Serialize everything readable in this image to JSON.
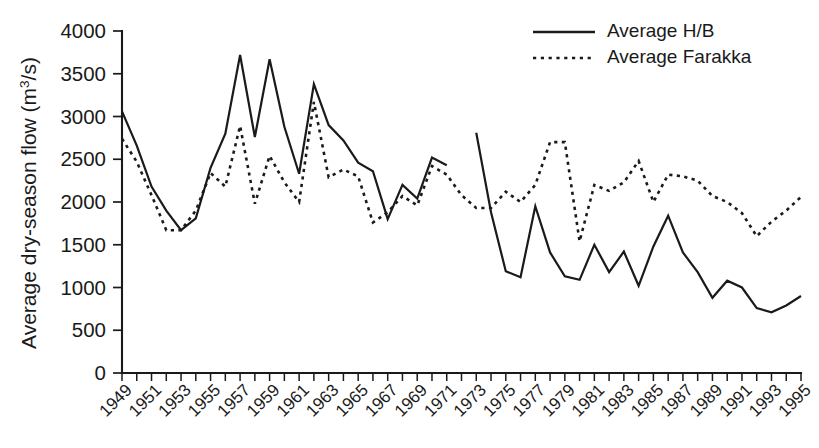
{
  "chart_data": {
    "type": "line",
    "title": "",
    "xlabel": "",
    "ylabel": "Average dry-season flow (m³/s)",
    "ylabel_base": "Average dry-season flow (m",
    "ylabel_sup": "3",
    "ylabel_tail": "/s)",
    "ylim": [
      0,
      4000
    ],
    "ytick_step": 500,
    "ytick_labels": [
      "0",
      "500",
      "1000",
      "1500",
      "2000",
      "2500",
      "3000",
      "3500",
      "4000"
    ],
    "ytick_values": [
      0,
      500,
      1000,
      1500,
      2000,
      2500,
      3000,
      3500,
      4000
    ],
    "xlim": [
      1949,
      1995
    ],
    "x": [
      1949,
      1950,
      1951,
      1952,
      1953,
      1954,
      1955,
      1956,
      1957,
      1958,
      1959,
      1960,
      1961,
      1962,
      1963,
      1964,
      1965,
      1966,
      1967,
      1968,
      1969,
      1970,
      1971,
      1972,
      1973,
      1974,
      1975,
      1976,
      1977,
      1978,
      1979,
      1980,
      1981,
      1982,
      1983,
      1984,
      1985,
      1986,
      1987,
      1988,
      1989,
      1990,
      1991,
      1992,
      1993,
      1994,
      1995
    ],
    "xtick_labels": [
      "1949",
      "1951",
      "1953",
      "1955",
      "1957",
      "1959",
      "1961",
      "1963",
      "1965",
      "1967",
      "1969",
      "1971",
      "1973",
      "1975",
      "1977",
      "1979",
      "1981",
      "1983",
      "1985",
      "1987",
      "1989",
      "1991",
      "1993",
      "1995"
    ],
    "xtick_values": [
      1949,
      1951,
      1953,
      1955,
      1957,
      1959,
      1961,
      1963,
      1965,
      1967,
      1969,
      1971,
      1973,
      1975,
      1977,
      1979,
      1981,
      1983,
      1985,
      1987,
      1989,
      1991,
      1993,
      1995
    ],
    "grid": false,
    "legend_position": "top-right",
    "series": [
      {
        "name": "Average H/B",
        "style": "solid",
        "color": "#1a1a1a",
        "values": [
          3060,
          2660,
          2180,
          1900,
          1670,
          1810,
          2400,
          2800,
          3720,
          2760,
          3670,
          2880,
          2330,
          3380,
          2900,
          2720,
          2460,
          2360,
          1800,
          2200,
          2040,
          2520,
          2430,
          null,
          2810,
          1880,
          1190,
          1120,
          1950,
          1410,
          1130,
          1090,
          1500,
          1180,
          1420,
          1020,
          1480,
          1840,
          1410,
          1180,
          880,
          1080,
          1000,
          760,
          710,
          790,
          900
        ]
      },
      {
        "name": "Average Farakka",
        "style": "dotted",
        "color": "#1a1a1a",
        "values": [
          2740,
          2470,
          2080,
          1670,
          1670,
          1900,
          2340,
          2180,
          2890,
          1980,
          2540,
          2230,
          2000,
          3170,
          2290,
          2380,
          2300,
          1760,
          1880,
          2070,
          1960,
          2420,
          2320,
          2080,
          1930,
          1930,
          2120,
          2000,
          2200,
          2700,
          2700,
          1540,
          2200,
          2130,
          2230,
          2480,
          2000,
          2320,
          2300,
          2250,
          2070,
          2000,
          1870,
          1600,
          1770,
          1900,
          2060
        ]
      }
    ]
  },
  "legend": {
    "items": [
      {
        "label": "Average H/B",
        "style": "solid"
      },
      {
        "label": "Average Farakka",
        "style": "dotted"
      }
    ]
  }
}
